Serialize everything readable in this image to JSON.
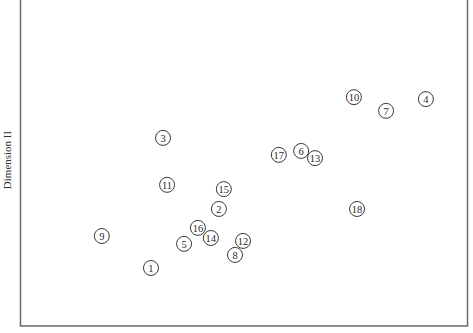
{
  "chart_data": {
    "type": "scatter",
    "title": "",
    "xlabel": "",
    "ylabel": "Dimension II",
    "xlim": [
      0,
      100
    ],
    "ylim": [
      0,
      100
    ],
    "grid": false,
    "legend": "none",
    "marker": "numbered-circle",
    "points": [
      {
        "label": "1",
        "x": 29.3,
        "y": 17.8
      },
      {
        "label": "2",
        "x": 44.5,
        "y": 35.9
      },
      {
        "label": "3",
        "x": 32.0,
        "y": 57.7
      },
      {
        "label": "4",
        "x": 90.8,
        "y": 69.6
      },
      {
        "label": "5",
        "x": 36.7,
        "y": 25.2
      },
      {
        "label": "6",
        "x": 62.9,
        "y": 53.7
      },
      {
        "label": "7",
        "x": 81.9,
        "y": 66.0
      },
      {
        "label": "8",
        "x": 48.1,
        "y": 21.8
      },
      {
        "label": "9",
        "x": 18.3,
        "y": 27.6
      },
      {
        "label": "10",
        "x": 74.7,
        "y": 70.2
      },
      {
        "label": "11",
        "x": 32.9,
        "y": 43.3
      },
      {
        "label": "12",
        "x": 49.9,
        "y": 26.1
      },
      {
        "label": "13",
        "x": 66.0,
        "y": 51.5
      },
      {
        "label": "14",
        "x": 42.7,
        "y": 27.0
      },
      {
        "label": "15",
        "x": 45.6,
        "y": 42.0
      },
      {
        "label": "16",
        "x": 39.8,
        "y": 30.1
      },
      {
        "label": "17",
        "x": 57.9,
        "y": 52.5
      },
      {
        "label": "18",
        "x": 75.4,
        "y": 35.9
      }
    ]
  }
}
